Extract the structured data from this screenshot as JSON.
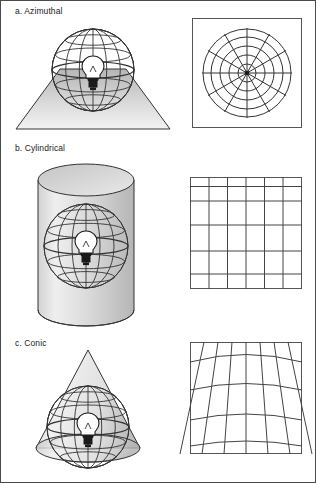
{
  "figure": {
    "border_color": "#4a4a4a",
    "line_color": "#333333",
    "fill_light": "#e6e6e6",
    "fill_mid": "#c9c9c9",
    "fill_dark": "#9a9a9a"
  },
  "sections": [
    {
      "key": "azimuthal",
      "caption": "a. Azimuthal",
      "surface_name": "plane",
      "surface_icon": "plane-trapezoid-icon",
      "globe_icon": "wireframe-globe-icon",
      "lamp_icon": "light-bulb-icon",
      "grid": {
        "type": "polar",
        "circles": 5,
        "radials": 12,
        "center_dot": true
      }
    },
    {
      "key": "cylindrical",
      "caption": "b. Cylindrical",
      "surface_name": "cylinder",
      "surface_icon": "cylinder-icon",
      "globe_icon": "wireframe-globe-icon",
      "lamp_icon": "light-bulb-icon",
      "grid": {
        "type": "rectangular",
        "columns": 6,
        "rows": 6,
        "row_fractions": [
          0.0,
          0.085,
          0.215,
          0.43,
          0.66,
          0.865,
          1.0
        ],
        "col_fractions": [
          0.0,
          0.17,
          0.335,
          0.5,
          0.665,
          0.83,
          1.0
        ]
      }
    },
    {
      "key": "conic",
      "caption": "c. Conic",
      "surface_name": "cone",
      "surface_icon": "cone-icon",
      "globe_icon": "wireframe-globe-icon",
      "lamp_icon": "light-bulb-icon",
      "grid": {
        "type": "conic",
        "parallels": 4,
        "meridians": 7,
        "apex_convergence": true
      }
    }
  ],
  "globe": {
    "parallels": 5,
    "meridians": 6,
    "equator_emphasis": true
  }
}
